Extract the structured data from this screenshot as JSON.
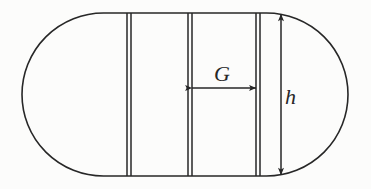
{
  "figure": {
    "kind": "geometric-diagram",
    "background_color": "#fcfcfb",
    "stroke_color": "#272727"
  },
  "canvas": {
    "width": 371,
    "height": 189
  },
  "outline": {
    "name": "stadium-outline",
    "left_cap_center_x": 103.5,
    "right_cap_center_x": 266.5,
    "center_y": 94.5,
    "radius": 81.5,
    "top_y": 13,
    "bottom_y": 176,
    "left_extent_x": 22,
    "right_extent_x": 348,
    "stroke_width": 1.6
  },
  "dividers": [
    {
      "name": "divider-1",
      "x1": 127.0,
      "x2": 131.0
    },
    {
      "name": "divider-2",
      "x1": 188.0,
      "x2": 192.0
    },
    {
      "name": "divider-3",
      "x1": 256.0,
      "x2": 260.0
    }
  ],
  "dimensions": {
    "gap": {
      "label": "G",
      "label_x": 222,
      "label_y": 81,
      "font_size": 22,
      "arrow_y": 88,
      "arrow_x_start": 192,
      "arrow_x_end": 256,
      "orientation": "horizontal"
    },
    "height": {
      "label": "h",
      "label_x": 285,
      "label_y": 104,
      "font_size": 22,
      "arrow_x": 281,
      "arrow_y_start": 14,
      "arrow_y_end": 175,
      "orientation": "vertical"
    }
  }
}
